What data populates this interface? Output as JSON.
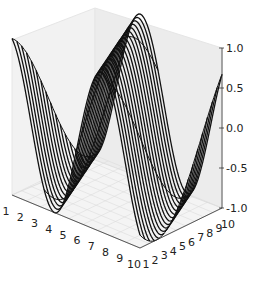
{
  "chart_data": {
    "type": "wireframe3d",
    "title": "",
    "xlabel": "",
    "ylabel": "",
    "zlabel": "",
    "x_ticks": [
      "1",
      "2",
      "3",
      "4",
      "5",
      "6",
      "7",
      "8",
      "9",
      "10"
    ],
    "y_ticks": [
      "1",
      "2",
      "3",
      "4",
      "5",
      "6",
      "7",
      "8",
      "9",
      "10"
    ],
    "z_ticks": [
      "-1.0",
      "-0.5",
      "0.0",
      "0.5",
      "1.0"
    ],
    "xlim": [
      1,
      10
    ],
    "ylim": [
      1,
      10
    ],
    "zlim": [
      -1,
      1
    ],
    "grid": true,
    "surface": "z = sin(x + phase(y)), phase shifting gradually along y; rendered as black wireframe lines",
    "line_color": "#111111",
    "pane_color": "#f2f2f2",
    "grid_color": "#d9d9d9"
  }
}
